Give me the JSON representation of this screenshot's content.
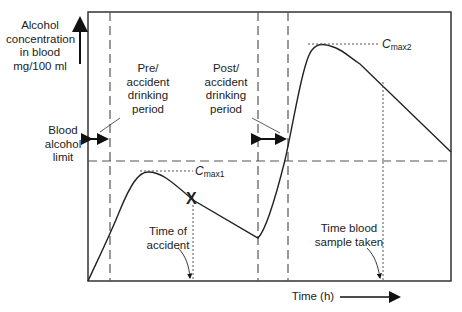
{
  "diagram": {
    "y_axis_label": [
      "Alcohol",
      "concentration",
      "in blood",
      "mg/100 ml"
    ],
    "x_axis_label": "Time (h)",
    "limit_label": [
      "Blood",
      "alcohol",
      "limit"
    ],
    "pre_period_label": [
      "Pre/",
      "accident",
      "drinking",
      "period"
    ],
    "post_period_label": [
      "Post/",
      "accident",
      "drinking",
      "period"
    ],
    "cmax1": {
      "c": "C",
      "sub": "max1"
    },
    "cmax2": {
      "c": "C",
      "sub": "max2"
    },
    "accident_label": [
      "Time of",
      "accident"
    ],
    "sample_label": [
      "Time blood",
      "sample taken"
    ],
    "accident_marker": "X",
    "colors": {
      "line": "#222222",
      "dash": "#555555",
      "frame": "#333333"
    }
  }
}
